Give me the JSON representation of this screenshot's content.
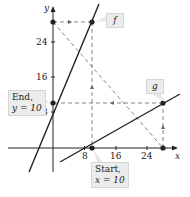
{
  "diagram": {
    "axes": {
      "x_label": "x",
      "y_label": "y",
      "x_ticks": [
        "8",
        "16",
        "24"
      ],
      "y_ticks": [
        "24",
        "16",
        "8"
      ]
    },
    "functions": [
      {
        "name": "f",
        "label": "f",
        "type": "line",
        "color": "#222222"
      },
      {
        "name": "g",
        "label": "g",
        "type": "line",
        "color": "#222222"
      }
    ],
    "callouts": {
      "start_line1": "Start,",
      "start_line2": "x = 10",
      "end_line1": "End,",
      "end_line2": "y = 10"
    },
    "points": [
      {
        "x": 0,
        "y": 28
      },
      {
        "x": 10,
        "y": 28
      },
      {
        "x": 10,
        "y": 0
      },
      {
        "x": 28,
        "y": 0
      },
      {
        "x": 28,
        "y": 10
      },
      {
        "x": 0,
        "y": 10
      }
    ]
  }
}
